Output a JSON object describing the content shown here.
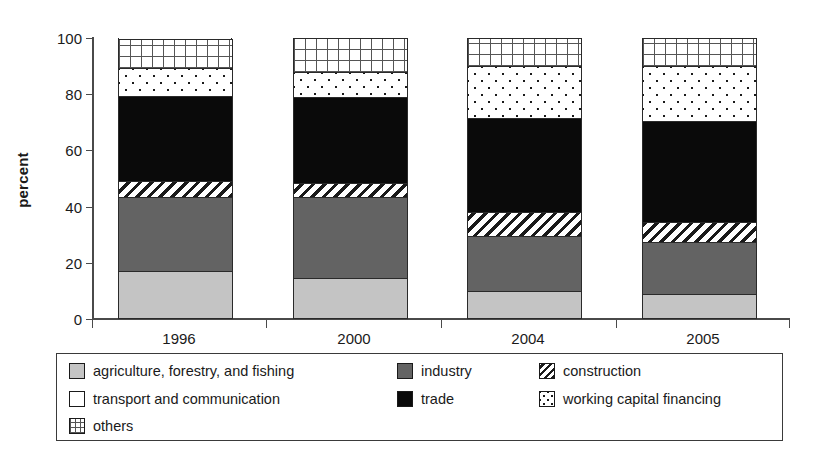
{
  "chart_data": {
    "type": "bar",
    "subtype": "stacked-100-percent",
    "title": "",
    "xlabel": "",
    "ylabel": "percent",
    "ylim": [
      0,
      100
    ],
    "yticks": [
      0,
      20,
      40,
      60,
      80,
      100
    ],
    "ytick_labels": [
      "0",
      "20",
      "40",
      "60",
      "80",
      "100"
    ],
    "grid": false,
    "legend_position": "bottom",
    "categories": [
      "1996",
      "2000",
      "2004",
      "2005"
    ],
    "series": [
      {
        "name": "agriculture, forestry, and fishing",
        "pattern": "solid-light-gray",
        "color": "#c4c4c4",
        "values": [
          17.0,
          14.5,
          10.0,
          9.0
        ]
      },
      {
        "name": "industry",
        "pattern": "solid-dark-gray",
        "color": "#636363",
        "values": [
          26.5,
          29.0,
          19.5,
          18.5
        ]
      },
      {
        "name": "construction",
        "pattern": "diagonal-hatch",
        "color": "#ffffff",
        "values": [
          5.5,
          5.0,
          8.5,
          7.0
        ]
      },
      {
        "name": "transport and communication",
        "pattern": "white",
        "color": "#ffffff",
        "values": [
          0.0,
          0.0,
          0.0,
          0.0
        ]
      },
      {
        "name": "trade",
        "pattern": "solid-black",
        "color": "#0a0a0a",
        "values": [
          30.5,
          30.5,
          33.5,
          36.0
        ]
      },
      {
        "name": "working capital financing",
        "pattern": "dots",
        "color": "#ffffff",
        "values": [
          10.0,
          9.0,
          18.5,
          19.5
        ]
      },
      {
        "name": "others",
        "pattern": "grid",
        "color": "#ffffff",
        "values": [
          10.0,
          12.0,
          10.0,
          10.0
        ]
      }
    ],
    "cumulative_boundaries": {
      "1996": [
        17.0,
        43.5,
        49.0,
        49.0,
        79.5,
        89.5,
        100
      ],
      "2000": [
        14.5,
        43.5,
        48.5,
        48.5,
        79.0,
        88.0,
        100
      ],
      "2004": [
        10.0,
        29.5,
        38.0,
        38.0,
        71.5,
        90.0,
        100
      ],
      "2005": [
        9.0,
        27.5,
        34.5,
        34.5,
        70.5,
        90.0,
        100
      ]
    }
  },
  "axis": {
    "y_title": "percent",
    "y_tick_labels": [
      "100",
      "80",
      "60",
      "40",
      "20",
      "0"
    ],
    "x_tick_labels": [
      "1996",
      "2000",
      "2004",
      "2005"
    ]
  },
  "legend": {
    "items": [
      {
        "label": "agriculture, forestry, and fishing",
        "swatch": "fill-agri"
      },
      {
        "label": "industry",
        "swatch": "fill-industry"
      },
      {
        "label": "construction",
        "swatch": "sw-constr"
      },
      {
        "label": "transport and communication",
        "swatch": "fill-transport"
      },
      {
        "label": "trade",
        "swatch": "fill-trade"
      },
      {
        "label": "working capital financing",
        "swatch": "sw-wcf"
      },
      {
        "label": "others",
        "swatch": "sw-others"
      }
    ]
  }
}
